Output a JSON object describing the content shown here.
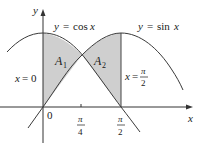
{
  "figure": {
    "y_axis_label": "y",
    "x_axis_label": "x",
    "origin_label": "0",
    "curves": [
      {
        "name": "cos",
        "label_lhs": "y",
        "label_eq": "=",
        "label_fn": "cos",
        "label_var": "x"
      },
      {
        "name": "sin",
        "label_lhs": "y",
        "label_eq": "=",
        "label_fn": "sin",
        "label_var": "x"
      }
    ],
    "regions": [
      {
        "label": "A",
        "subscript": "1"
      },
      {
        "label": "A",
        "subscript": "2"
      }
    ],
    "vertical_lines": [
      {
        "label_var": "x",
        "label_eq": "=",
        "label_val": "0"
      },
      {
        "label_var": "x",
        "label_eq": "=",
        "label_num": "π",
        "label_den": "2"
      }
    ],
    "x_ticks": [
      {
        "num": "π",
        "den": "4"
      },
      {
        "num": "π",
        "den": "2"
      }
    ]
  },
  "colors": {
    "shade": "#cfcfcf",
    "curve": "#3a3a3a",
    "axis": "#333333",
    "text": "#1a1a1a"
  }
}
